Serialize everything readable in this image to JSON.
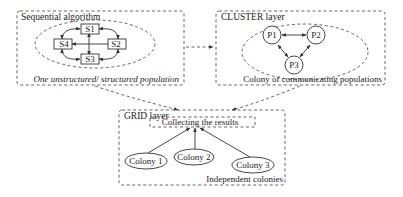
{
  "diagram": {
    "panels": {
      "sequential": {
        "title": "Sequential algorithm",
        "caption": "One unstructured/ structured population",
        "nodes": [
          "S1",
          "S2",
          "S3",
          "S4"
        ]
      },
      "cluster": {
        "title": "CLUSTER layer",
        "caption": "Colony of communicating populations",
        "nodes": [
          "P1",
          "P2",
          "P3"
        ]
      },
      "grid": {
        "title": "GRID layer",
        "collector": "Collecting the results",
        "caption": "Independent colonies",
        "nodes": [
          "Colony 1",
          "Colony 2",
          "Colony 3"
        ]
      }
    },
    "colors": {
      "stroke": "#333333",
      "dashed": "#555555",
      "background": "#ffffff"
    }
  }
}
